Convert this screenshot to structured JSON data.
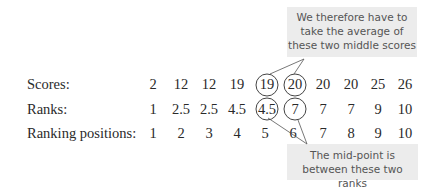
{
  "callouts": {
    "top": "We therefore have to take the average of these two middle scores",
    "bottom": "The mid-point is between these two ranks"
  },
  "rows": [
    {
      "label": "Scores:",
      "values": [
        "2",
        "12",
        "12",
        "19",
        "19",
        "20",
        "20",
        "20",
        "25",
        "26"
      ]
    },
    {
      "label": "Ranks:",
      "values": [
        "1",
        "2.5",
        "2.5",
        "4.5",
        "4.5",
        "7",
        "7",
        "7",
        "9",
        "10"
      ]
    },
    {
      "label": "Ranking positions:",
      "values": [
        "1",
        "2",
        "3",
        "4",
        "5",
        "6",
        "7",
        "8",
        "9",
        "10"
      ]
    }
  ],
  "highlighted": {
    "scores": [
      4,
      5
    ],
    "ranks": [
      4,
      5
    ]
  }
}
